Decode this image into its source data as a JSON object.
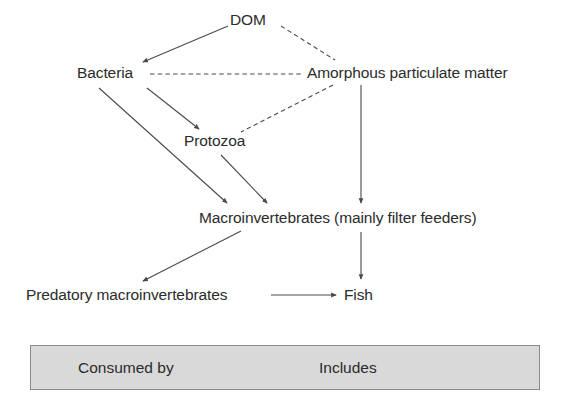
{
  "diagram": {
    "line_color": "#4a4a4a",
    "text_color": "#2b2b2b",
    "legend_fill": "#d9d9d9",
    "legend_border": "#8a8a8a",
    "nodes": [
      {
        "id": "dom",
        "label": "DOM"
      },
      {
        "id": "bacteria",
        "label": "Bacteria"
      },
      {
        "id": "amorphous",
        "label": "Amorphous particulate matter"
      },
      {
        "id": "protozoa",
        "label": "Protozoa"
      },
      {
        "id": "macroinvertebrates",
        "label": "Macroinvertebrates (mainly filter feeders)"
      },
      {
        "id": "predatory",
        "label": "Predatory macroinvertebrates"
      },
      {
        "id": "fish",
        "label": "Fish"
      }
    ],
    "edges": [
      {
        "from": "dom",
        "to": "bacteria",
        "style": "solid",
        "relation": "Consumed by"
      },
      {
        "from": "dom",
        "to": "amorphous",
        "style": "dashed",
        "relation": "Includes"
      },
      {
        "from": "bacteria",
        "to": "amorphous",
        "style": "dashed",
        "relation": "Includes"
      },
      {
        "from": "bacteria",
        "to": "protozoa",
        "style": "solid",
        "relation": "Consumed by"
      },
      {
        "from": "bacteria",
        "to": "macroinvertebrates",
        "style": "solid",
        "relation": "Consumed by"
      },
      {
        "from": "amorphous",
        "to": "protozoa",
        "style": "dashed",
        "relation": "Includes"
      },
      {
        "from": "amorphous",
        "to": "macroinvertebrates",
        "style": "solid",
        "relation": "Consumed by"
      },
      {
        "from": "protozoa",
        "to": "macroinvertebrates",
        "style": "solid",
        "relation": "Consumed by"
      },
      {
        "from": "macroinvertebrates",
        "to": "predatory",
        "style": "solid",
        "relation": "Consumed by"
      },
      {
        "from": "macroinvertebrates",
        "to": "fish",
        "style": "solid",
        "relation": "Consumed by"
      },
      {
        "from": "predatory",
        "to": "fish",
        "style": "solid",
        "relation": "Consumed by"
      }
    ]
  },
  "legend": {
    "consumed_by_label": "Consumed by",
    "includes_label": "Includes"
  }
}
